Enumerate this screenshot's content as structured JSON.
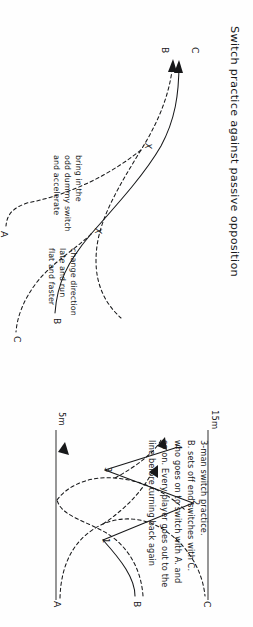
{
  "figure": {
    "orientation": "rotated-90-clockwise",
    "ink_color": "#17181a",
    "paper_color": "#fefefe"
  },
  "top_diagram": {
    "title": "Switch practice against passive opposition",
    "player_labels": {
      "a": "A",
      "b": "B",
      "c": "C"
    },
    "cross_markers": [
      "X",
      "X"
    ],
    "annotations": {
      "left": [
        "bring in the",
        "odd dummy switch",
        "and accelerate"
      ],
      "right": [
        "change direction",
        "late and run",
        "flat and faster"
      ]
    }
  },
  "bottom_diagram": {
    "caption": [
      "3-man switch practice.",
      "B. sets off end switches with C.",
      "who goes on to switch with A. and",
      "so on. Every player goes out to the",
      "line before turning back again"
    ],
    "distance_labels": {
      "near": "5m",
      "far": "15m"
    },
    "player_labels": {
      "a": "A",
      "b": "B",
      "c": "C"
    },
    "sequence_numbers": [
      "1",
      "2",
      "3",
      "4"
    ]
  }
}
